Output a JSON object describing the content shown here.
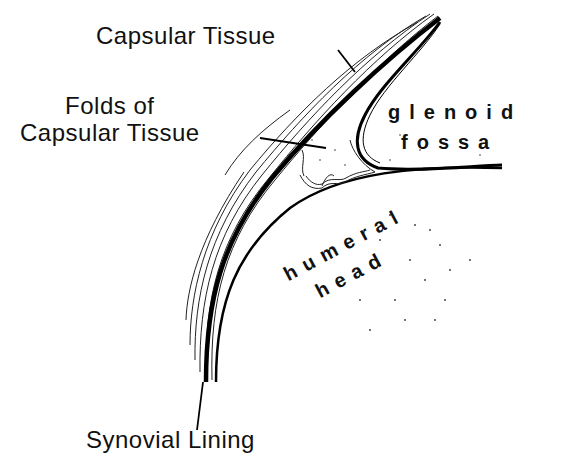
{
  "figure": {
    "type": "anatomical-line-drawing",
    "labels": {
      "capsular_tissue": "Capsular Tissue",
      "folds_line1": "Folds of",
      "folds_line2": "Capsular Tissue",
      "glenoid_line1": "glenoid",
      "glenoid_line2": "fossa",
      "humeral_line1": "humeral",
      "humeral_line2": "head",
      "synovial_lining": "Synovial Lining"
    },
    "colors": {
      "ink": "#111111",
      "background": "#ffffff"
    }
  }
}
